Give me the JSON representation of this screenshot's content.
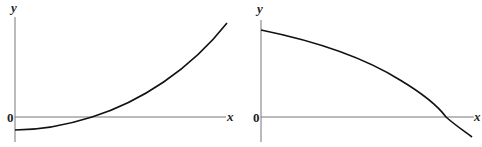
{
  "graphs": [
    {
      "x_label": "x",
      "y_label": "y",
      "origin_label": "0",
      "description": "Increasing concave-up curve starting below the x-axis at the y-axis, crossing the x-axis and rising steeply"
    },
    {
      "x_label": "x",
      "y_label": "y",
      "origin_label": "0",
      "description": "Decreasing concave-down curve starting high on the y-axis, falling and crossing the x-axis near the right end"
    }
  ]
}
